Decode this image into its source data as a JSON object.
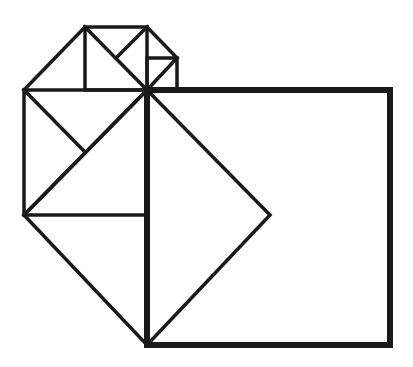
{
  "diagram": {
    "title": "",
    "type": "pythagorean-squares-construction",
    "stroke_color": "#1a1a1a",
    "background": "#ffffff",
    "central_vertex": [
      147,
      90
    ],
    "large_square": {
      "points": [
        [
          147,
          90
        ],
        [
          390,
          90
        ],
        [
          390,
          345
        ],
        [
          147,
          345
        ]
      ],
      "stroke_width": 6
    },
    "middle_square": {
      "points": [
        [
          24,
          90
        ],
        [
          147,
          90
        ],
        [
          147,
          215
        ],
        [
          24,
          215
        ]
      ],
      "diagonal": [
        [
          147,
          90
        ],
        [
          24,
          215
        ]
      ],
      "half_diagonal": [
        [
          24,
          90
        ],
        [
          85,
          152
        ]
      ],
      "stroke_width": 3.5
    },
    "diamond": {
      "points": [
        [
          147,
          90
        ],
        [
          270,
          215
        ],
        [
          147,
          345
        ],
        [
          24,
          215
        ]
      ],
      "stroke_width": 3.5
    },
    "top_square": {
      "points": [
        [
          85,
          27
        ],
        [
          147,
          27
        ],
        [
          147,
          90
        ],
        [
          85,
          90
        ]
      ],
      "diagonal": [
        [
          85,
          27
        ],
        [
          147,
          90
        ]
      ],
      "half_diagonal": [
        [
          147,
          27
        ],
        [
          116,
          58
        ]
      ],
      "stroke_width": 3.5
    },
    "top_left_triangle_edge": [
      [
        24,
        90
      ],
      [
        85,
        27
      ]
    ],
    "small_square": {
      "points": [
        [
          147,
          58
        ],
        [
          177,
          58
        ],
        [
          177,
          90
        ],
        [
          147,
          90
        ]
      ],
      "diagonal": [
        [
          147,
          90
        ],
        [
          177,
          58
        ]
      ],
      "stroke_width": 3.5
    },
    "small_triangle_edge": [
      [
        147,
        27
      ],
      [
        177,
        58
      ]
    ]
  }
}
